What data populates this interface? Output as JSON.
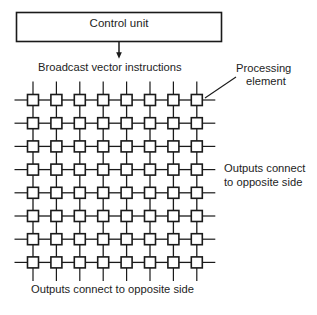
{
  "figure": {
    "type": "block-diagram",
    "background_color": "#ffffff",
    "stroke_color": "#1a1a1a",
    "node_fill_color": "#ffffff"
  },
  "control_unit": {
    "label": "Control unit",
    "box": {
      "x": 16,
      "y": 12,
      "width": 206,
      "height": 30
    }
  },
  "arrow": {
    "name": "broadcast-arrow",
    "from_x": 119,
    "from_y": 42,
    "to_x": 119,
    "to_y": 58
  },
  "broadcast": {
    "label": "Broadcast vector instructions"
  },
  "processing_element_callout": {
    "line_1": "Processing",
    "line_2": "element",
    "leader": {
      "x1": 206,
      "y1": 97,
      "x2": 237,
      "y2": 76
    }
  },
  "outputs_right": {
    "line_1": "Outputs connect",
    "line_2": "to opposite side"
  },
  "outputs_bottom": {
    "label": "Outputs connect to opposite side"
  },
  "grid": {
    "rows": 8,
    "columns": 8,
    "first_center_x": 33,
    "first_center_y": 100,
    "column_spacing": 23.4,
    "row_spacing": 23.2,
    "node_size": 11,
    "stub_length": 13,
    "node_shape": "square",
    "topology": "mesh-with-wraparound"
  }
}
